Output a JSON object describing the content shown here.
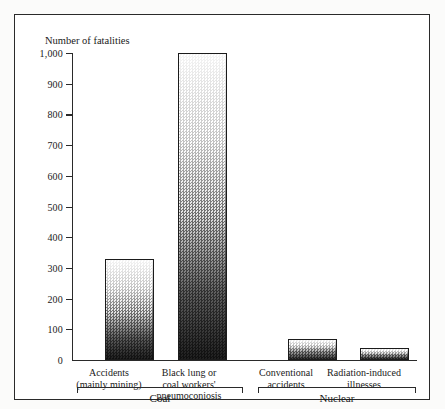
{
  "chart_data": {
    "type": "bar",
    "title": "",
    "ylabel": "Number of fatalities",
    "xlabel": "",
    "ylim": [
      0,
      1000
    ],
    "grid": false,
    "legend": "none",
    "y_ticks": [
      "1,000",
      "900",
      "800",
      "700",
      "600",
      "500",
      "400",
      "300",
      "200",
      "100",
      "0"
    ],
    "y_tick_values": [
      1000,
      900,
      800,
      700,
      600,
      500,
      400,
      300,
      200,
      100,
      0
    ],
    "categories": [
      "Accidents (mainly mining)",
      "Black lung or coal workers' pneumoconiosis",
      "Conventional accidents",
      "Radiation-induced illnesses"
    ],
    "values": [
      330,
      1000,
      70,
      40
    ],
    "groups": [
      {
        "name": "Coal",
        "categories": [
          0,
          1
        ]
      },
      {
        "name": "Nuclear",
        "categories": [
          2,
          3
        ]
      }
    ],
    "bars": [
      {
        "label_lines": [
          "Accidents",
          "(mainly mining)"
        ],
        "value": 330,
        "group": "Coal"
      },
      {
        "label_lines": [
          "Black lung or",
          "coal workers'",
          "pneumoconiosis"
        ],
        "value": 1000,
        "group": "Coal"
      },
      {
        "label_lines": [
          "Conventional",
          "accidents"
        ],
        "value": 70,
        "group": "Nuclear"
      },
      {
        "label_lines": [
          "Radiation-induced",
          "illnesses"
        ],
        "value": 40,
        "group": "Nuclear"
      }
    ]
  },
  "axis": {
    "y_title": "Number of fatalities"
  },
  "labels": {
    "bar0_line1": "Accidents",
    "bar0_line2": "(mainly mining)",
    "bar1_line1": "Black lung or",
    "bar1_line2": "coal workers'",
    "bar1_line3": "pneumoconiosis",
    "bar2_line1": "Conventional",
    "bar2_line2": "accidents",
    "bar3_line1": "Radiation-induced",
    "bar3_line2": "illnesses",
    "group0": "Coal",
    "group1": "Nuclear"
  },
  "ticks": {
    "t1000": "1,000",
    "t900": "900",
    "t800": "800",
    "t700": "700",
    "t600": "600",
    "t500": "500",
    "t400": "400",
    "t300": "300",
    "t200": "200",
    "t100": "100",
    "t0": "0"
  },
  "colors": {
    "ink": "#2a2a2a",
    "bar_light": "#ffffff",
    "bar_dark": "#1b1b1b",
    "page_background": "#fbfbfa",
    "plot_background": "#ffffff"
  }
}
